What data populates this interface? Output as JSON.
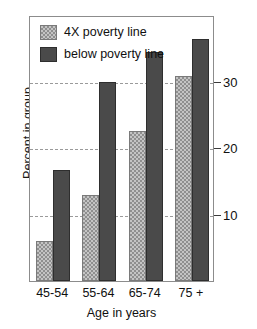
{
  "chart_data": {
    "type": "bar",
    "title": "",
    "xlabel": "Age in years",
    "ylabel": "Percent in group",
    "categories": [
      "45-54",
      "55-64",
      "65-74",
      "75 +"
    ],
    "series": [
      {
        "name": "4X poverty line",
        "values": [
          6.0,
          12.9,
          22.6,
          30.8
        ],
        "color": "#c4c4c4"
      },
      {
        "name": "below poverty line",
        "values": [
          16.7,
          30.0,
          34.4,
          36.4
        ],
        "color": "#4a4a4a"
      }
    ],
    "yticks": [
      10,
      20,
      30
    ],
    "ytick_labels": [
      "10",
      "20",
      "30"
    ],
    "ylim": [
      0,
      40
    ],
    "grid": true,
    "grid_style": "dashed",
    "legend_position": "top-left",
    "yaxis_side": "right"
  },
  "legend": {
    "items": [
      {
        "label": "4X poverty line",
        "swatch": "light-hatched"
      },
      {
        "label": "below poverty line",
        "swatch": "dark-solid"
      }
    ]
  },
  "axes": {
    "y_title": "Percent in group",
    "x_title": "Age in years",
    "y_tick_labels": [
      "30",
      "20",
      "10"
    ],
    "x_tick_labels": [
      "45-54",
      "55-64",
      "65-74",
      "75 +"
    ]
  },
  "colors": {
    "light_bar": "#c4c4c4",
    "light_bar_hatch": "#8f8f8f",
    "dark_bar": "#4a4a4a",
    "grid": "#9a9a9a",
    "frame": "#8c8c8c",
    "text": "#101010"
  }
}
